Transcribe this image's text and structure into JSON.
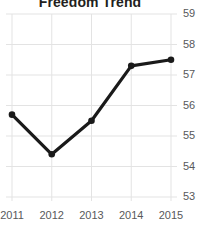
{
  "chart_data": {
    "type": "line",
    "title": "Freedom Trend",
    "xlabel": "",
    "ylabel": "",
    "categories": [
      "2011",
      "2012",
      "2013",
      "2014",
      "2015"
    ],
    "x": [
      2011,
      2012,
      2013,
      2014,
      2015
    ],
    "values": [
      55.7,
      54.4,
      55.5,
      57.3,
      57.5
    ],
    "series": [
      {
        "name": "Freedom Trend",
        "values": [
          55.7,
          54.4,
          55.5,
          57.3,
          57.5
        ]
      }
    ],
    "ylim": [
      53,
      59
    ],
    "xlim": [
      2011,
      2015
    ],
    "ytick_labels": [
      "59",
      "58",
      "57",
      "56",
      "55",
      "54",
      "53"
    ],
    "ytick_values": [
      59,
      58,
      57,
      56,
      55,
      54,
      53
    ],
    "xtick_labels": [
      "2011",
      "2012",
      "2013",
      "2014",
      "2015"
    ],
    "grid": true,
    "grid_axes": "both",
    "y_axis_side": "right",
    "legend": false,
    "legend_position": "none",
    "markers": "circle",
    "line_color": "#1a1a1a",
    "marker_color": "#1a1a1a",
    "grid_color": "#e3e3e3",
    "tick_label_color": "#58595b",
    "title_color": "#231f20",
    "background_color": "#ffffff"
  }
}
